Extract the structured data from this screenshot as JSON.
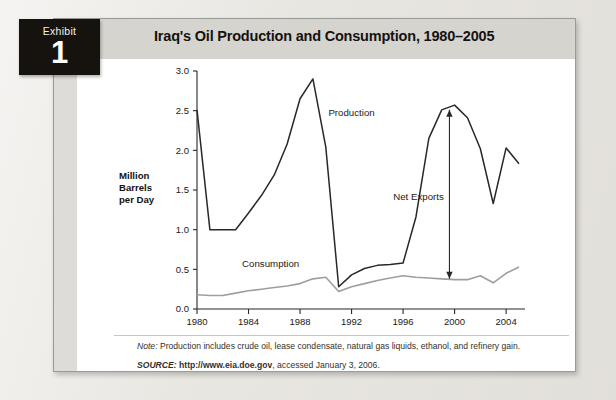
{
  "exhibit": {
    "word": "Exhibit",
    "number": "1",
    "title": "Iraq's Oil Production and Consumption, 1980–2005"
  },
  "notes": {
    "note_label": "Note:",
    "note_text": " Production includes crude oil, lease condensate, natural gas liquids, ethanol, and refinery gain.",
    "source_label": "SOURCE:",
    "source_url": " http://www.eia.doe.gov",
    "source_rest": ", accessed January 3, 2006."
  },
  "chart_data": {
    "type": "line",
    "title": "Iraq's Oil Production and Consumption, 1980–2005",
    "xlabel": "",
    "ylabel": "Million Barrels per Day",
    "ylim": [
      0.0,
      3.0
    ],
    "xlim": [
      1980,
      2005
    ],
    "yticks": [
      "0.0",
      "0.5",
      "1.0",
      "1.5",
      "2.0",
      "2.5",
      "3.0"
    ],
    "ytick_values": [
      0.0,
      0.5,
      1.0,
      1.5,
      2.0,
      2.5,
      3.0
    ],
    "xticks": [
      "1980",
      "1984",
      "1988",
      "1992",
      "1996",
      "2000",
      "2004"
    ],
    "xtick_values": [
      1980,
      1984,
      1988,
      1992,
      1996,
      2000,
      2004
    ],
    "grid": false,
    "legend": "inline-annotations",
    "x": [
      1980,
      1981,
      1982,
      1983,
      1984,
      1985,
      1986,
      1987,
      1988,
      1989,
      1990,
      1991,
      1992,
      1993,
      1994,
      1995,
      1996,
      1997,
      1998,
      1999,
      2000,
      2001,
      2002,
      2003,
      2004,
      2005
    ],
    "series": [
      {
        "name": "Production",
        "color": "#2b2724",
        "values": [
          2.51,
          1.0,
          1.0,
          1.0,
          1.21,
          1.43,
          1.69,
          2.08,
          2.65,
          2.9,
          2.04,
          0.28,
          0.43,
          0.51,
          0.55,
          0.56,
          0.58,
          1.16,
          2.15,
          2.51,
          2.57,
          2.41,
          2.02,
          1.33,
          2.03,
          1.83
        ]
      },
      {
        "name": "Consumption",
        "color": "#9e9e9c",
        "values": [
          0.18,
          0.17,
          0.17,
          0.2,
          0.23,
          0.25,
          0.27,
          0.29,
          0.32,
          0.38,
          0.4,
          0.22,
          0.28,
          0.32,
          0.36,
          0.39,
          0.42,
          0.4,
          0.39,
          0.38,
          0.37,
          0.37,
          0.42,
          0.33,
          0.45,
          0.53
        ]
      }
    ],
    "annotations": [
      {
        "name": "production-label",
        "text": "Production",
        "x": 1990.2,
        "y": 2.43
      },
      {
        "name": "consumption-label",
        "text": "Consumption",
        "x": 1983.5,
        "y": 0.53
      },
      {
        "name": "net-exports-label",
        "text": "Net Exports",
        "x": 1997.2,
        "y": 1.37
      },
      {
        "name": "net-exports-arrow",
        "text": "",
        "x": 1999.6,
        "y_top": 2.51,
        "y_bottom": 0.38
      }
    ]
  }
}
